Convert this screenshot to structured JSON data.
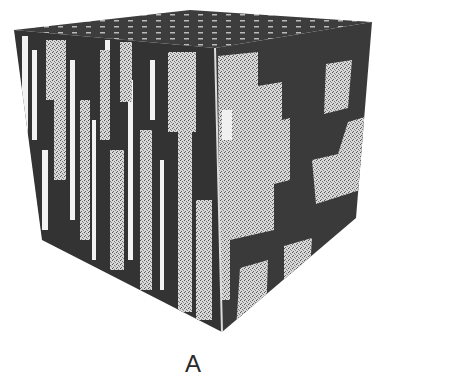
{
  "figure": {
    "label": "A",
    "colors": {
      "background": "#ffffff",
      "dark": "#3a3a3a",
      "light_speckle": "#cfcfcf",
      "white": "#f4f4f4",
      "label": "#2a2a2a"
    }
  }
}
